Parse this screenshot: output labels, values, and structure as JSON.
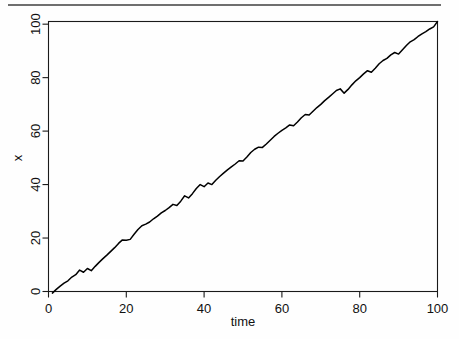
{
  "figure": {
    "top_rule_color": "#6f6f6f",
    "background_color": "#fefefe",
    "line_color": "#000000",
    "axis_color": "#1a1a1a"
  },
  "chart_data": {
    "type": "line",
    "title": "",
    "subtitle": "",
    "xlabel": "time",
    "ylabel": "x",
    "xlim": [
      0,
      100
    ],
    "ylim": [
      0,
      101
    ],
    "xticks": [
      0,
      20,
      40,
      60,
      80,
      100
    ],
    "yticks": [
      0,
      20,
      40,
      60,
      80,
      100
    ],
    "xtick_labels": [
      "0",
      "20",
      "40",
      "60",
      "80",
      "100"
    ],
    "ytick_labels": [
      "0",
      "20",
      "40",
      "60",
      "80",
      "100"
    ],
    "grid": false,
    "legend": null,
    "legend_position": "none",
    "series": [
      {
        "name": "x",
        "color": "#000000",
        "x": [
          1,
          2,
          3,
          4,
          5,
          6,
          7,
          8,
          9,
          10,
          11,
          12,
          13,
          14,
          15,
          16,
          17,
          18,
          19,
          20,
          21,
          22,
          23,
          24,
          25,
          26,
          27,
          28,
          29,
          30,
          31,
          32,
          33,
          34,
          35,
          36,
          37,
          38,
          39,
          40,
          41,
          42,
          43,
          44,
          45,
          46,
          47,
          48,
          49,
          50,
          51,
          52,
          53,
          54,
          55,
          56,
          57,
          58,
          59,
          60,
          61,
          62,
          63,
          64,
          65,
          66,
          67,
          68,
          69,
          70,
          71,
          72,
          73,
          74,
          75,
          76,
          77,
          78,
          79,
          80,
          81,
          82,
          83,
          84,
          85,
          86,
          87,
          88,
          89,
          90,
          91,
          92,
          93,
          94,
          95,
          96,
          97,
          98,
          99,
          100
        ],
        "values": [
          -0.6,
          0.8,
          2.0,
          3.1,
          4.0,
          5.4,
          6.3,
          8.0,
          7.2,
          8.6,
          7.8,
          9.4,
          10.9,
          12.3,
          13.6,
          15.0,
          16.4,
          18.0,
          19.3,
          19.2,
          19.5,
          21.4,
          23.2,
          24.6,
          25.2,
          26.0,
          27.2,
          28.2,
          29.4,
          30.3,
          31.4,
          32.6,
          32.2,
          33.8,
          35.8,
          35.0,
          36.6,
          38.5,
          40.0,
          39.2,
          40.6,
          40.0,
          41.6,
          43.0,
          44.3,
          45.5,
          46.6,
          47.7,
          48.9,
          48.8,
          50.3,
          52.0,
          53.2,
          54.0,
          53.9,
          55.2,
          56.6,
          58.0,
          59.2,
          60.3,
          61.2,
          62.3,
          62.0,
          63.4,
          65.0,
          66.2,
          66.0,
          67.4,
          68.8,
          70.0,
          71.4,
          72.6,
          73.9,
          75.2,
          75.8,
          74.2,
          75.6,
          77.3,
          78.8,
          80.0,
          81.4,
          82.6,
          82.0,
          83.5,
          85.2,
          86.4,
          87.2,
          88.5,
          89.4,
          88.8,
          90.4,
          92.0,
          93.4,
          94.2,
          95.4,
          96.4,
          97.2,
          98.2,
          99.0,
          101.0
        ]
      }
    ]
  }
}
